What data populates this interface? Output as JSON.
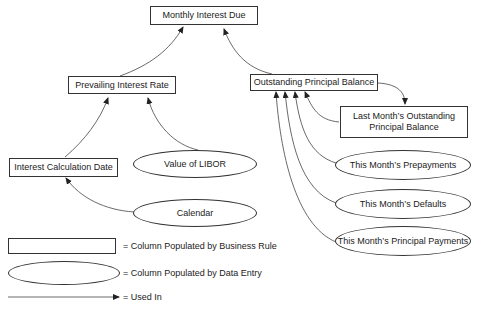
{
  "diagram": {
    "nodes": {
      "monthly_interest_due": {
        "label": "Monthly Interest Due",
        "shape": "rectangle"
      },
      "prevailing_interest_rate": {
        "label": "Prevailing Interest Rate",
        "shape": "rectangle"
      },
      "outstanding_principal_balance": {
        "label": "Outstanding Principal Balance",
        "shape": "rectangle"
      },
      "last_months_outstanding_principal_balance": {
        "label": "Last Month’s Outstanding Principal Balance",
        "shape": "rectangle"
      },
      "interest_calculation_date": {
        "label": "Interest Calculation Date",
        "shape": "rectangle"
      },
      "value_of_libor": {
        "label": "Value of LIBOR",
        "shape": "ellipse"
      },
      "calendar": {
        "label": "Calendar",
        "shape": "ellipse"
      },
      "this_months_prepayments": {
        "label": "This Month’s Prepayments",
        "shape": "ellipse"
      },
      "this_months_defaults": {
        "label": "This Month’s Defaults",
        "shape": "ellipse"
      },
      "this_months_principal_payments": {
        "label": "This Month’s Principal Payments",
        "shape": "ellipse"
      }
    },
    "edges": [
      {
        "from": "Prevailing Interest Rate",
        "to": "Monthly Interest Due"
      },
      {
        "from": "Outstanding Principal Balance",
        "to": "Monthly Interest Due"
      },
      {
        "from": "Interest Calculation Date",
        "to": "Prevailing Interest Rate"
      },
      {
        "from": "Value of LIBOR",
        "to": "Prevailing Interest Rate"
      },
      {
        "from": "Calendar",
        "to": "Interest Calculation Date"
      },
      {
        "from": "Outstanding Principal Balance",
        "to": "Last Month’s Outstanding Principal Balance"
      },
      {
        "from": "Last Month’s Outstanding Principal Balance",
        "to": "Outstanding Principal Balance"
      },
      {
        "from": "This Month’s Prepayments",
        "to": "Outstanding Principal Balance"
      },
      {
        "from": "This Month’s Defaults",
        "to": "Outstanding Principal Balance"
      },
      {
        "from": "This Month’s Principal Payments",
        "to": "Outstanding Principal Balance"
      }
    ]
  },
  "legend": {
    "rectangle": "= Column Populated by Business Rule",
    "ellipse": "= Column Populated by Data Entry",
    "arrow": "= Used In"
  },
  "colors": {
    "stroke": "#333333",
    "background": "#ffffff",
    "text": "#222222"
  }
}
